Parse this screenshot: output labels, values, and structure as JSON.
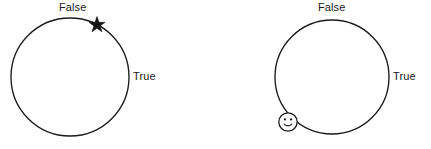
{
  "figure": {
    "type": "state-transition-loop-diagram",
    "background_color": "#ffffff",
    "stroke_color": "#1a1a1a",
    "width": 431,
    "height": 149
  },
  "nodes": [
    {
      "id": "loop-left",
      "name": "left-loop",
      "shape": "circle",
      "center_x": 70,
      "center_y": 77,
      "radius": 59,
      "labels": {
        "false": "False",
        "true": "True"
      },
      "marker": {
        "kind": "star-marker",
        "glyph": "star",
        "fill": "#141414",
        "x": 97,
        "y": 25,
        "size": 9
      }
    },
    {
      "id": "loop-right",
      "name": "right-loop",
      "shape": "circle",
      "center_x": 332,
      "center_y": 77,
      "radius": 57,
      "labels": {
        "false": "False",
        "true": "True"
      },
      "marker": {
        "kind": "smiley-marker",
        "glyph": "smiley-face",
        "fill": "#ffffff",
        "x": 288,
        "y": 122,
        "size": 9
      }
    }
  ]
}
